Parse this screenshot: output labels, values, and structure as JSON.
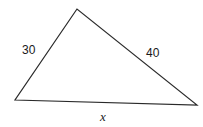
{
  "diagram": {
    "type": "triangle",
    "stroke_color": "#2a2a2a",
    "vertices": {
      "top": [
        77,
        9
      ],
      "left": [
        15,
        100
      ],
      "right": [
        197,
        105
      ]
    },
    "labels": {
      "left_side": "30",
      "right_side": "40",
      "bottom_side": "x"
    }
  }
}
